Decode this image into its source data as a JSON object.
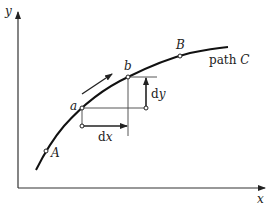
{
  "diagram": {
    "axes": {
      "x_label": "x",
      "y_label": "y"
    },
    "path": {
      "name_prefix": "path ",
      "name": "C"
    },
    "points": {
      "start": "A",
      "end": "B",
      "a": "a",
      "b": "b"
    },
    "differentials": {
      "dx_prefix": "d",
      "dx_var": "x",
      "dy_prefix": "d",
      "dy_var": "y"
    },
    "colors": {
      "ink": "#222222",
      "background": "#ffffff"
    }
  }
}
